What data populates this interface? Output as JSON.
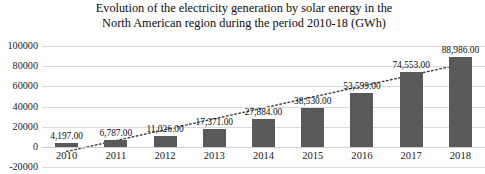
{
  "chart_data": {
    "type": "bar",
    "title": "Evolution of the electricity generation by solar energy in the\nNorth American region during the period 2010-18 (GWh)",
    "subtitle": "",
    "xlabel": "",
    "ylabel": "",
    "categories": [
      "2010",
      "2011",
      "2012",
      "2013",
      "2014",
      "2015",
      "2016",
      "2017",
      "2018"
    ],
    "values": [
      4197,
      6787,
      11026,
      17371,
      27884,
      38530,
      53599,
      74553,
      88986
    ],
    "data_labels": [
      "4,197.00",
      "6,787.00",
      "11,026.00",
      "17,371.00",
      "27,884.00",
      "38,530.00",
      "53,599.00",
      "74,553.00",
      "88,986.00"
    ],
    "ylim": [
      -20000,
      100000
    ],
    "y_ticks": [
      100000,
      80000,
      60000,
      40000,
      20000,
      0,
      -20000
    ],
    "y_tick_labels": [
      "100000",
      "80000",
      "60000",
      "40000",
      "20000",
      "0",
      "-20000"
    ],
    "grid": true,
    "legend": "none",
    "bar_color": "#595959",
    "gridline_color": "#d9d9d9",
    "series": [
      {
        "name": "Solar electricity generation (GWh)",
        "values": [
          4197,
          6787,
          11026,
          17371,
          27884,
          38530,
          53599,
          74553,
          88986
        ]
      },
      {
        "name": "Linear trendline",
        "type": "line",
        "style": "dotted",
        "color": "#3f3f3f",
        "values": [
          -4600,
          6200,
          17000,
          27800,
          38600,
          49400,
          60200,
          71000,
          81800
        ]
      }
    ]
  }
}
